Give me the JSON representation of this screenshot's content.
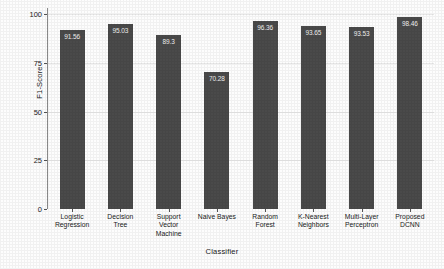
{
  "chart_data": {
    "type": "bar",
    "title": "",
    "xlabel": "Classifier",
    "ylabel": "F1-Score",
    "categories": [
      "Logistic Regression",
      "Decision Tree",
      "Support Vector Machine",
      "Naive Bayes",
      "Random Forest",
      "K-Nearest Neighbors",
      "Multi-Layer Perceptron",
      "Proposed DCNN"
    ],
    "category_lines": [
      [
        "Logistic",
        "Regression"
      ],
      [
        "Decision",
        "Tree"
      ],
      [
        "Support",
        "Vector",
        "Machine"
      ],
      [
        "Naive Bayes"
      ],
      [
        "Random",
        "Forest"
      ],
      [
        "K-Nearest",
        "Neighbors"
      ],
      [
        "Multi-Layer",
        "Perceptron"
      ],
      [
        "Proposed",
        "DCNN"
      ]
    ],
    "values": [
      91.56,
      95.03,
      89.3,
      70.28,
      96.36,
      93.65,
      93.53,
      98.46
    ],
    "value_labels": [
      "91.56",
      "95.03",
      "89.3",
      "70.28",
      "96.36",
      "93.65",
      "93.53",
      "98.46"
    ],
    "ylim": [
      0,
      100
    ],
    "yticks": [
      0,
      25,
      50,
      75,
      100
    ],
    "ytick_labels": [
      "0",
      "25",
      "50",
      "75",
      "100"
    ],
    "grid": true,
    "legend": false,
    "bar_color": "#4a4a4a",
    "label_color": "#f2f2f2",
    "grid_color": "#e8e8e8",
    "background_color": "#fdfdfd"
  }
}
